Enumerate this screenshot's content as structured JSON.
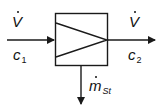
{
  "diagram": {
    "type": "process-block",
    "block": {
      "symbol": "triangle-right-in-box",
      "x": 55,
      "y": 13,
      "width": 53,
      "height": 53
    },
    "inputs": [
      {
        "symbol": "V",
        "symbol_dot": true,
        "label_main": "V",
        "property_main": "c",
        "property_sub": "1",
        "direction": "right",
        "from": [
          7,
          40
        ],
        "to": [
          55,
          40
        ]
      }
    ],
    "outputs": [
      {
        "label_main": "V",
        "symbol_dot": true,
        "property_main": "c",
        "property_sub": "2",
        "direction": "right",
        "from": [
          108,
          40
        ],
        "to": [
          155,
          40
        ]
      },
      {
        "label_main": "m",
        "symbol_dot": true,
        "label_sub": "St",
        "direction": "down",
        "from": [
          81,
          66
        ],
        "to": [
          81,
          104
        ]
      }
    ],
    "colors": {
      "stroke": "#1a1a1a",
      "background": "#ffffff"
    }
  }
}
